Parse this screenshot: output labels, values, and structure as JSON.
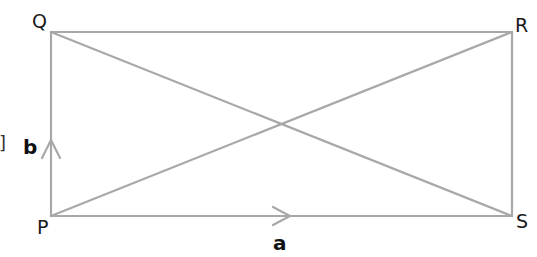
{
  "diagram": {
    "type": "rectangle-with-diagonals",
    "line_color": "#a8a8a8",
    "label_color": "#1a1a1a",
    "vertices": {
      "Q": {
        "label": "Q",
        "x": 51,
        "y": 32
      },
      "R": {
        "label": "R",
        "x": 512,
        "y": 32
      },
      "P": {
        "label": "P",
        "x": 51,
        "y": 216
      },
      "S": {
        "label": "S",
        "x": 512,
        "y": 216
      }
    },
    "edges": [
      {
        "from": "P",
        "to": "Q"
      },
      {
        "from": "Q",
        "to": "R"
      },
      {
        "from": "R",
        "to": "S"
      },
      {
        "from": "P",
        "to": "S"
      },
      {
        "from": "P",
        "to": "R"
      },
      {
        "from": "Q",
        "to": "S"
      }
    ],
    "vectors": [
      {
        "name": "a",
        "label": "a",
        "edge": "P-S",
        "direction": "right"
      },
      {
        "name": "b",
        "label": "b",
        "edge": "P-Q",
        "direction": "up"
      }
    ],
    "margin_mark": "]"
  }
}
